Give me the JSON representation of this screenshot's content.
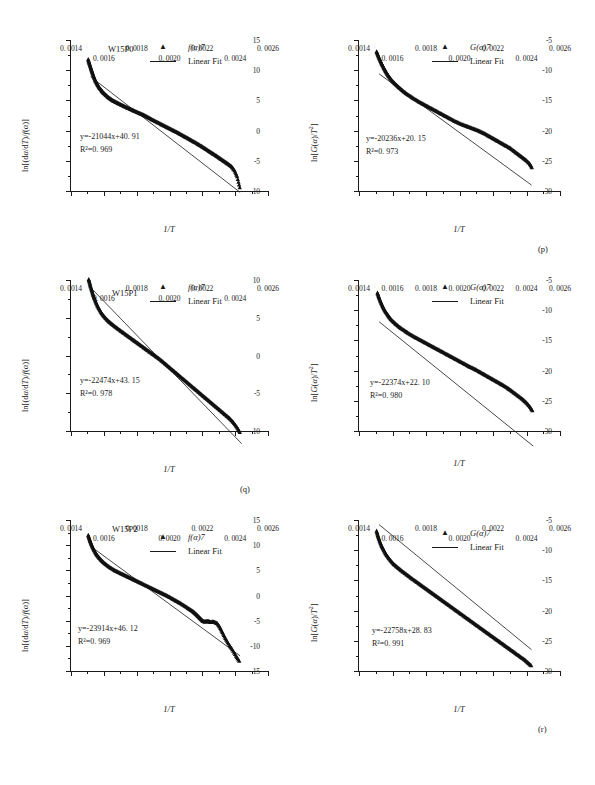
{
  "figure": {
    "panel_captions": [
      "(p)",
      "(q)",
      "(r)"
    ],
    "xaxis_title": "1/T",
    "yaxis_title_left": "ln[(dα/dT)/f(α)]",
    "yaxis_title_right": "ln[G(α)/T²]",
    "x_tick_labels": [
      "0. 0014",
      "0. 0016",
      "0. 0018",
      "0. 0020",
      "0. 0022",
      "0. 0024",
      "0. 0026"
    ],
    "x_tick_values": [
      0.0014,
      0.0016,
      0.0018,
      0.002,
      0.0022,
      0.0024,
      0.0026
    ],
    "legend_left": {
      "marker_label": "f(α)7",
      "line_label": "Linear Fit",
      "marker_glyph": "▲"
    },
    "legend_right": {
      "marker_label": "G(α)7",
      "line_label": "Linear Fit",
      "marker_glyph": "▲"
    }
  },
  "chart_data": [
    {
      "id": "p-left",
      "type": "scatter",
      "panel": "(p)",
      "sample_id": "W15P0",
      "title": "",
      "xlabel": "1/T",
      "ylabel": "ln[(dα/dT)/f(α)]",
      "xlim": [
        0.0014,
        0.0026
      ],
      "ylim": [
        -10,
        15
      ],
      "ytick_labels": [
        "15",
        "10",
        "5",
        "0",
        "-5",
        "-10"
      ],
      "ytick_values": [
        15,
        10,
        5,
        0,
        -5,
        -10
      ],
      "grid": false,
      "legend_position": "top-right",
      "fit_equation": "y=-21044x+40. 91",
      "fit_r2": "R²=0. 969",
      "fit_slope": -21044,
      "fit_intercept": 40.91,
      "fit_r2_value": 0.969,
      "fit_line_x": [
        0.00152,
        0.00243
      ],
      "series": [
        {
          "name": "f(α)7",
          "x": [
            0.001505,
            0.00151,
            0.001516,
            0.001522,
            0.001528,
            0.001534,
            0.001541,
            0.001548,
            0.001556,
            0.001564,
            0.001573,
            0.001583,
            0.001593,
            0.001604,
            0.001616,
            0.001628,
            0.001641,
            0.001654,
            0.001668,
            0.001682,
            0.001697,
            0.001712,
            0.001727,
            0.001743,
            0.001759,
            0.001775,
            0.001791,
            0.001808,
            0.001825,
            0.001842,
            0.001859,
            0.001876,
            0.001893,
            0.001911,
            0.001929,
            0.001947,
            0.001965,
            0.001983,
            0.002001,
            0.002019,
            0.002037,
            0.002055,
            0.002073,
            0.002091,
            0.002109,
            0.002127,
            0.002145,
            0.002163,
            0.002181,
            0.002199,
            0.002216,
            0.002233,
            0.00225,
            0.002267,
            0.002284,
            0.0023,
            0.002316,
            0.002332,
            0.002348,
            0.002364,
            0.00238,
            0.002396,
            0.002412,
            0.002428
          ],
          "y": [
            11.8,
            11.3,
            10.8,
            10.3,
            9.8,
            9.3,
            8.8,
            8.3,
            7.9,
            7.5,
            7.1,
            6.75,
            6.4,
            6.1,
            5.8,
            5.5,
            5.25,
            5.0,
            4.8,
            4.6,
            4.4,
            4.2,
            4.0,
            3.8,
            3.6,
            3.4,
            3.2,
            3.0,
            2.8,
            2.6,
            2.35,
            2.1,
            1.85,
            1.6,
            1.35,
            1.1,
            0.85,
            0.6,
            0.35,
            0.1,
            -0.15,
            -0.4,
            -0.68,
            -0.95,
            -1.22,
            -1.5,
            -1.78,
            -2.05,
            -2.35,
            -2.65,
            -2.95,
            -3.25,
            -3.55,
            -3.85,
            -4.15,
            -4.45,
            -4.75,
            -5.05,
            -5.35,
            -5.65,
            -6.0,
            -6.6,
            -7.6,
            -9.4
          ]
        }
      ]
    },
    {
      "id": "p-right",
      "type": "scatter",
      "panel": "(p)",
      "sample_id": "",
      "title": "",
      "xlabel": "1/T",
      "ylabel": "ln[G(α)/T²]",
      "xlim": [
        0.0014,
        0.0026
      ],
      "ylim": [
        -30,
        -5
      ],
      "ytick_labels": [
        "-5",
        "-10",
        "-15",
        "-20",
        "-25",
        "-30"
      ],
      "ytick_values": [
        -5,
        -10,
        -15,
        -20,
        -25,
        -30
      ],
      "grid": false,
      "legend_position": "top-right",
      "fit_equation": "y=-20236x+20. 15",
      "fit_r2": "R²=0. 973",
      "fit_slope": -20236,
      "fit_intercept": 20.15,
      "fit_r2_value": 0.973,
      "fit_line_x": [
        0.00152,
        0.00243
      ],
      "series": [
        {
          "name": "G(α)7",
          "x": [
            0.001505,
            0.001512,
            0.001519,
            0.001527,
            0.001535,
            0.001544,
            0.001554,
            0.001564,
            0.001575,
            0.001587,
            0.0016,
            0.001614,
            0.001629,
            0.001645,
            0.001662,
            0.00168,
            0.001698,
            0.001717,
            0.001737,
            0.001757,
            0.001777,
            0.001797,
            0.001817,
            0.001837,
            0.001857,
            0.001877,
            0.001897,
            0.001917,
            0.001937,
            0.001957,
            0.001977,
            0.001997,
            0.002017,
            0.002037,
            0.002056,
            0.002075,
            0.002094,
            0.002113,
            0.002132,
            0.002151,
            0.00217,
            0.002189,
            0.002208,
            0.002227,
            0.002246,
            0.002265,
            0.002284,
            0.002303,
            0.002322,
            0.002341,
            0.00236,
            0.002379,
            0.002398,
            0.002417,
            0.002432
          ],
          "y": [
            -6.9,
            -7.4,
            -7.9,
            -8.4,
            -8.9,
            -9.4,
            -9.9,
            -10.4,
            -10.9,
            -11.35,
            -11.8,
            -12.2,
            -12.6,
            -13.0,
            -13.4,
            -13.8,
            -14.15,
            -14.5,
            -14.85,
            -15.2,
            -15.5,
            -15.8,
            -16.1,
            -16.4,
            -16.7,
            -17.0,
            -17.3,
            -17.6,
            -17.9,
            -18.2,
            -18.5,
            -18.75,
            -19.0,
            -19.2,
            -19.4,
            -19.6,
            -19.8,
            -20.0,
            -20.25,
            -20.5,
            -20.8,
            -21.1,
            -21.4,
            -21.7,
            -22.0,
            -22.3,
            -22.6,
            -22.9,
            -23.3,
            -23.7,
            -24.1,
            -24.5,
            -24.9,
            -25.4,
            -26.1
          ]
        }
      ]
    },
    {
      "id": "q-left",
      "type": "scatter",
      "panel": "(q)",
      "sample_id": "W15P1",
      "title": "",
      "xlabel": "1/T",
      "ylabel": "ln[(dα/dT)/f(α)]",
      "xlim": [
        0.0014,
        0.0026
      ],
      "ylim": [
        -10,
        10
      ],
      "ytick_labels": [
        "10",
        "5",
        "0",
        "-5",
        "-10"
      ],
      "ytick_values": [
        10,
        5,
        0,
        -5,
        -10
      ],
      "grid": false,
      "legend_position": "top-right",
      "fit_equation": "y=-22474x+43. 15",
      "fit_r2": "R²=0. 978",
      "fit_slope": -22474,
      "fit_intercept": 43.15,
      "fit_r2_value": 0.978,
      "fit_line_x": [
        0.00152,
        0.00244
      ],
      "series": [
        {
          "name": "f(α)7",
          "x": [
            0.001508,
            0.001514,
            0.00152,
            0.001527,
            0.001534,
            0.001542,
            0.001551,
            0.001561,
            0.001572,
            0.001584,
            0.001597,
            0.001611,
            0.001626,
            0.001642,
            0.001659,
            0.001677,
            0.001695,
            0.001714,
            0.001733,
            0.001752,
            0.001771,
            0.00179,
            0.001809,
            0.001828,
            0.001847,
            0.001866,
            0.001885,
            0.001904,
            0.001923,
            0.001942,
            0.001961,
            0.00198,
            0.001999,
            0.002018,
            0.002037,
            0.002056,
            0.002075,
            0.002094,
            0.002113,
            0.002132,
            0.002151,
            0.00217,
            0.002189,
            0.002208,
            0.002227,
            0.002246,
            0.002265,
            0.002284,
            0.002303,
            0.002322,
            0.002341,
            0.00236,
            0.002379,
            0.002398,
            0.002417,
            0.002432
          ],
          "y": [
            10.1,
            9.6,
            9.1,
            8.6,
            8.1,
            7.6,
            7.1,
            6.6,
            6.15,
            5.7,
            5.3,
            4.95,
            4.6,
            4.3,
            4.0,
            3.7,
            3.4,
            3.1,
            2.8,
            2.5,
            2.2,
            1.9,
            1.6,
            1.3,
            1.0,
            0.7,
            0.4,
            0.1,
            -0.2,
            -0.5,
            -0.85,
            -1.2,
            -1.55,
            -1.9,
            -2.25,
            -2.6,
            -2.95,
            -3.3,
            -3.65,
            -4.0,
            -4.35,
            -4.7,
            -5.05,
            -5.4,
            -5.75,
            -6.1,
            -6.45,
            -6.8,
            -7.15,
            -7.5,
            -7.85,
            -8.2,
            -8.6,
            -9.1,
            -9.7,
            -10.3
          ]
        }
      ]
    },
    {
      "id": "q-right",
      "type": "scatter",
      "panel": "(q)",
      "sample_id": "",
      "title": "",
      "xlabel": "1/T",
      "ylabel": "ln[G(α)/T²]",
      "xlim": [
        0.0014,
        0.0026
      ],
      "ylim": [
        -30,
        -5
      ],
      "ytick_labels": [
        "-5",
        "-10",
        "-15",
        "-20",
        "-25",
        "-30"
      ],
      "ytick_values": [
        -5,
        -10,
        -15,
        -20,
        -25,
        -30
      ],
      "grid": false,
      "legend_position": "top-right",
      "fit_equation": "y=-22374x+22. 10",
      "fit_r2": "R²=0. 980",
      "fit_slope": -22374,
      "fit_intercept": 22.1,
      "fit_r2_value": 0.98,
      "fit_line_x": [
        0.00152,
        0.00244
      ],
      "series": [
        {
          "name": "G(α)7",
          "x": [
            0.00151,
            0.001517,
            0.001525,
            0.001534,
            0.001544,
            0.001555,
            0.001567,
            0.00158,
            0.001594,
            0.001609,
            0.001625,
            0.001642,
            0.00166,
            0.001679,
            0.001698,
            0.001718,
            0.001738,
            0.001758,
            0.001778,
            0.001798,
            0.001818,
            0.001838,
            0.001858,
            0.001878,
            0.001898,
            0.001918,
            0.001938,
            0.001958,
            0.001978,
            0.001998,
            0.002018,
            0.002038,
            0.002057,
            0.002076,
            0.002095,
            0.002114,
            0.002133,
            0.002152,
            0.002171,
            0.00219,
            0.002209,
            0.002228,
            0.002247,
            0.002266,
            0.002285,
            0.002304,
            0.002323,
            0.002342,
            0.002361,
            0.00238,
            0.002399,
            0.002418,
            0.002435
          ],
          "y": [
            -7.1,
            -7.7,
            -8.3,
            -8.9,
            -9.5,
            -10.1,
            -10.6,
            -11.1,
            -11.6,
            -12.0,
            -12.4,
            -12.8,
            -13.15,
            -13.5,
            -13.85,
            -14.2,
            -14.5,
            -14.8,
            -15.1,
            -15.4,
            -15.7,
            -16.0,
            -16.3,
            -16.6,
            -16.9,
            -17.2,
            -17.5,
            -17.8,
            -18.1,
            -18.4,
            -18.7,
            -19.0,
            -19.3,
            -19.55,
            -19.8,
            -20.1,
            -20.4,
            -20.7,
            -21.0,
            -21.3,
            -21.6,
            -21.9,
            -22.2,
            -22.5,
            -22.85,
            -23.2,
            -23.6,
            -24.0,
            -24.4,
            -24.8,
            -25.3,
            -25.9,
            -26.6
          ]
        }
      ]
    },
    {
      "id": "r-left",
      "type": "scatter",
      "panel": "(r)",
      "sample_id": "W15P2",
      "title": "",
      "xlabel": "1/T",
      "ylabel": "ln[(dα/dT)/f(α)]",
      "xlim": [
        0.0014,
        0.0026
      ],
      "ylim": [
        -15,
        15
      ],
      "ytick_labels": [
        "15",
        "10",
        "5",
        "0",
        "-5",
        "-10",
        "-15"
      ],
      "ytick_values": [
        15,
        10,
        5,
        0,
        -5,
        -10,
        -15
      ],
      "grid": false,
      "legend_position": "top-right",
      "fit_equation": "y=-23914x+46. 12",
      "fit_r2": "R²=0. 969",
      "fit_slope": -23914,
      "fit_intercept": 46.12,
      "fit_r2_value": 0.969,
      "fit_line_x": [
        0.00152,
        0.00243
      ],
      "series": [
        {
          "name": "f(α)7",
          "x": [
            0.001505,
            0.001511,
            0.001517,
            0.001524,
            0.001532,
            0.001541,
            0.001551,
            0.001562,
            0.001574,
            0.001587,
            0.001601,
            0.001616,
            0.001632,
            0.001649,
            0.001667,
            0.001685,
            0.001704,
            0.001723,
            0.001742,
            0.001761,
            0.00178,
            0.001799,
            0.001818,
            0.001837,
            0.001856,
            0.001875,
            0.001894,
            0.001913,
            0.001932,
            0.001951,
            0.00197,
            0.001989,
            0.002008,
            0.002027,
            0.002046,
            0.002065,
            0.002084,
            0.002103,
            0.002122,
            0.002141,
            0.002155,
            0.002168,
            0.00218,
            0.002192,
            0.002204,
            0.002216,
            0.002228,
            0.00224,
            0.002252,
            0.002264,
            0.002276,
            0.00229,
            0.002305,
            0.002322,
            0.00234,
            0.00236,
            0.002382,
            0.002405,
            0.002425
          ],
          "y": [
            12.0,
            11.4,
            10.8,
            10.2,
            9.6,
            9.0,
            8.4,
            7.9,
            7.4,
            6.95,
            6.5,
            6.1,
            5.7,
            5.35,
            5.0,
            4.7,
            4.4,
            4.1,
            3.8,
            3.5,
            3.2,
            2.9,
            2.6,
            2.3,
            2.0,
            1.7,
            1.4,
            1.1,
            0.8,
            0.5,
            0.2,
            -0.1,
            -0.45,
            -0.8,
            -1.15,
            -1.5,
            -1.9,
            -2.3,
            -2.7,
            -3.1,
            -3.5,
            -3.9,
            -4.3,
            -4.7,
            -5.1,
            -5.2,
            -5.1,
            -5.15,
            -5.3,
            -5.2,
            -5.3,
            -5.5,
            -6.2,
            -7.3,
            -8.5,
            -9.6,
            -10.7,
            -12.0,
            -13.0
          ]
        }
      ]
    },
    {
      "id": "r-right",
      "type": "scatter",
      "panel": "(r)",
      "sample_id": "",
      "title": "",
      "xlabel": "1/T",
      "ylabel": "ln[G(α)/T²]",
      "xlim": [
        0.0014,
        0.0026
      ],
      "ylim": [
        -30,
        -5
      ],
      "ytick_labels": [
        "-5",
        "-10",
        "-15",
        "-20",
        "-25",
        "-30"
      ],
      "ytick_values": [
        -5,
        -10,
        -15,
        -20,
        -25,
        -30
      ],
      "grid": false,
      "legend_position": "top-right",
      "fit_equation": "y=-22758x+28. 83",
      "fit_r2": "R²=0. 991",
      "fit_slope": -22758,
      "fit_intercept": 28.83,
      "fit_r2_value": 0.991,
      "fit_line_x": [
        0.00152,
        0.00243
      ],
      "series": [
        {
          "name": "G(α)7",
          "x": [
            0.001505,
            0.001512,
            0.00152,
            0.001529,
            0.001539,
            0.00155,
            0.001562,
            0.001575,
            0.001589,
            0.001604,
            0.00162,
            0.001637,
            0.001655,
            0.001674,
            0.001693,
            0.001712,
            0.001732,
            0.001752,
            0.001772,
            0.001792,
            0.001812,
            0.001832,
            0.001852,
            0.001872,
            0.001892,
            0.001912,
            0.001932,
            0.001952,
            0.001972,
            0.001992,
            0.002012,
            0.002032,
            0.002052,
            0.002072,
            0.002092,
            0.002112,
            0.002132,
            0.002152,
            0.002172,
            0.002192,
            0.002212,
            0.002232,
            0.002252,
            0.002272,
            0.002292,
            0.002312,
            0.002332,
            0.002352,
            0.002372,
            0.002392,
            0.002412,
            0.002428
          ],
          "y": [
            -6.8,
            -7.5,
            -8.2,
            -8.9,
            -9.5,
            -10.1,
            -10.7,
            -11.2,
            -11.7,
            -12.2,
            -12.6,
            -13.0,
            -13.4,
            -13.8,
            -14.2,
            -14.6,
            -15.0,
            -15.4,
            -15.8,
            -16.2,
            -16.6,
            -17.0,
            -17.4,
            -17.8,
            -18.2,
            -18.6,
            -19.0,
            -19.4,
            -19.8,
            -20.2,
            -20.6,
            -21.0,
            -21.4,
            -21.8,
            -22.2,
            -22.6,
            -23.0,
            -23.4,
            -23.8,
            -24.2,
            -24.6,
            -25.0,
            -25.4,
            -25.8,
            -26.2,
            -26.6,
            -27.0,
            -27.4,
            -27.8,
            -28.2,
            -28.7,
            -29.1
          ]
        }
      ]
    }
  ]
}
